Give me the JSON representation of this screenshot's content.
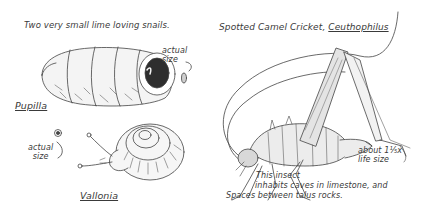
{
  "illustration": {
    "left_panel": {
      "title": "Two very small lime loving snails.",
      "pupilla": {
        "name": "Pupilla",
        "size_note": "actual\nsize"
      },
      "vallonia": {
        "name": "Vallonia",
        "size_note": "actual\nsize"
      }
    },
    "right_panel": {
      "title_prefix": "Spotted Camel Cricket, ",
      "genus": "Ceuthophilus",
      "scale_note": "about 1⅕x\nlife size",
      "habitat_line1": "This insect",
      "habitat_line2": "inhabits caves in limestone, and",
      "habitat_line3": "Spaces between talus rocks."
    },
    "colors": {
      "ink": "#3a3a3a",
      "background": "#ffffff"
    }
  }
}
